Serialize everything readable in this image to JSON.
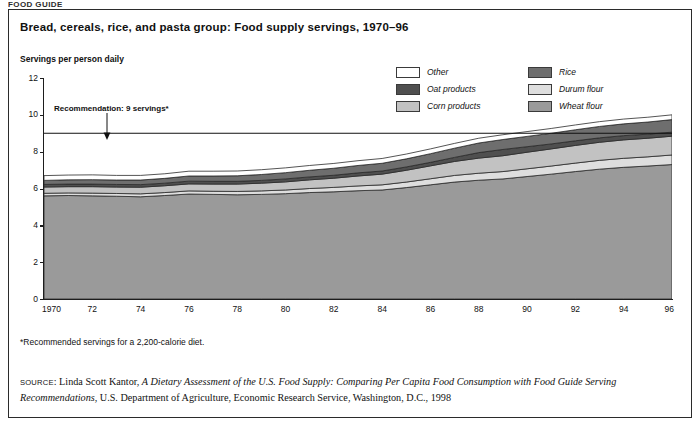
{
  "page_header": "FOOD GUIDE",
  "title": "Bread, cereals, rice, and pasta group: Food supply servings, 1970–96",
  "axis_title": "Servings per person daily",
  "annotation": {
    "text": "Recommendation: 9 servings*",
    "value": 9
  },
  "footnote": "*Recommended servings for a 2,200-calorie diet.",
  "source": {
    "keyword": "SOURCE",
    "part1": ": Linda Scott Kantor, ",
    "italic1": "A Dietary Assessment of the U.S. Food Supply: Comparing Per Capita Food Consumption with Food Guide Serving Recommendations",
    "part2": ", U.S. Department of Agriculture, Economic Research Service, Washington, D.C., 1998"
  },
  "legend": {
    "column1": [
      {
        "label": "Other",
        "color": "#ffffff"
      },
      {
        "label": "Oat products",
        "color": "#4f4f4f"
      },
      {
        "label": "Corn products",
        "color": "#c2c2c2"
      }
    ],
    "column2": [
      {
        "label": "Rice",
        "color": "#6e6e6e"
      },
      {
        "label": "Durum flour",
        "color": "#dedede"
      },
      {
        "label": "Wheat flour",
        "color": "#9a9a9a"
      }
    ]
  },
  "chart_data": {
    "type": "area",
    "title": "Bread, cereals, rice, and pasta group: Food supply servings, 1970–96",
    "xlabel": "",
    "ylabel": "Servings per person daily",
    "xlim": [
      1970,
      1996
    ],
    "ylim": [
      0,
      12
    ],
    "ytick_values": [
      0,
      2,
      4,
      6,
      8,
      10,
      12
    ],
    "xtick_labels": [
      "1970",
      "72",
      "74",
      "76",
      "78",
      "80",
      "82",
      "84",
      "86",
      "88",
      "90",
      "92",
      "94",
      "96"
    ],
    "xtick_values": [
      1970,
      1972,
      1974,
      1976,
      1978,
      1980,
      1982,
      1984,
      1986,
      1988,
      1990,
      1992,
      1994,
      1996
    ],
    "grid": false,
    "legend_position": "top-right",
    "stacked": true,
    "reference_line": {
      "label": "Recommendation: 9 servings*",
      "y": 9
    },
    "x": [
      1970,
      1971,
      1972,
      1973,
      1974,
      1975,
      1976,
      1977,
      1978,
      1979,
      1980,
      1981,
      1982,
      1983,
      1984,
      1985,
      1986,
      1987,
      1988,
      1989,
      1990,
      1991,
      1992,
      1993,
      1994,
      1995,
      1996
    ],
    "series": [
      {
        "name": "Wheat flour",
        "color": "#9a9a9a",
        "values": [
          5.6,
          5.62,
          5.6,
          5.58,
          5.55,
          5.62,
          5.7,
          5.68,
          5.66,
          5.68,
          5.72,
          5.78,
          5.82,
          5.88,
          5.92,
          6.05,
          6.2,
          6.35,
          6.45,
          6.52,
          6.65,
          6.78,
          6.92,
          7.05,
          7.15,
          7.22,
          7.3
        ]
      },
      {
        "name": "Durum flour",
        "color": "#dedede",
        "values": [
          0.14,
          0.14,
          0.15,
          0.15,
          0.16,
          0.16,
          0.17,
          0.17,
          0.18,
          0.19,
          0.2,
          0.22,
          0.24,
          0.26,
          0.28,
          0.3,
          0.33,
          0.36,
          0.38,
          0.4,
          0.42,
          0.44,
          0.46,
          0.48,
          0.49,
          0.5,
          0.52
        ]
      },
      {
        "name": "Corn products",
        "color": "#c2c2c2",
        "values": [
          0.34,
          0.34,
          0.35,
          0.35,
          0.36,
          0.37,
          0.38,
          0.39,
          0.4,
          0.42,
          0.44,
          0.47,
          0.5,
          0.54,
          0.58,
          0.64,
          0.7,
          0.76,
          0.82,
          0.86,
          0.9,
          0.93,
          0.96,
          0.98,
          1.0,
          1.01,
          1.02
        ]
      },
      {
        "name": "Oat products",
        "color": "#4f4f4f",
        "values": [
          0.14,
          0.14,
          0.14,
          0.14,
          0.14,
          0.14,
          0.15,
          0.15,
          0.15,
          0.15,
          0.16,
          0.16,
          0.16,
          0.17,
          0.17,
          0.18,
          0.19,
          0.22,
          0.3,
          0.34,
          0.3,
          0.27,
          0.25,
          0.24,
          0.23,
          0.22,
          0.22
        ]
      },
      {
        "name": "Rice",
        "color": "#6e6e6e",
        "values": [
          0.22,
          0.23,
          0.24,
          0.24,
          0.25,
          0.26,
          0.28,
          0.29,
          0.3,
          0.32,
          0.34,
          0.36,
          0.38,
          0.4,
          0.42,
          0.44,
          0.47,
          0.5,
          0.52,
          0.54,
          0.56,
          0.58,
          0.6,
          0.62,
          0.64,
          0.66,
          0.68
        ]
      },
      {
        "name": "Other",
        "color": "#ffffff",
        "values": [
          0.26,
          0.26,
          0.26,
          0.25,
          0.25,
          0.25,
          0.26,
          0.26,
          0.26,
          0.26,
          0.26,
          0.26,
          0.26,
          0.26,
          0.26,
          0.26,
          0.26,
          0.26,
          0.26,
          0.26,
          0.26,
          0.26,
          0.26,
          0.26,
          0.26,
          0.26,
          0.26
        ]
      }
    ],
    "totals": [
      6.7,
      6.73,
      6.74,
      6.71,
      6.71,
      6.8,
      6.94,
      6.94,
      6.95,
      7.02,
      7.12,
      7.25,
      7.36,
      7.51,
      7.63,
      7.87,
      8.15,
      8.45,
      8.73,
      8.92,
      9.09,
      9.26,
      9.45,
      9.63,
      9.77,
      9.87,
      10.0
    ]
  }
}
